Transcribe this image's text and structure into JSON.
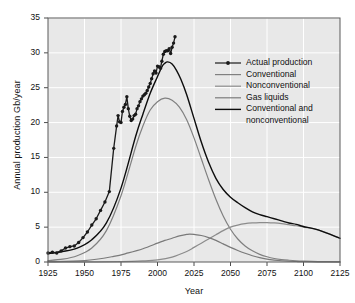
{
  "chart_data": {
    "type": "line",
    "title": "",
    "xlabel": "Year",
    "ylabel": "Annual production Gb/year",
    "xlim": [
      1925,
      2125
    ],
    "ylim": [
      0,
      35
    ],
    "xticks": [
      1925,
      1950,
      1975,
      2000,
      2025,
      2050,
      2075,
      2100,
      2125
    ],
    "yticks": [
      0,
      5,
      10,
      15,
      20,
      25,
      30,
      35
    ],
    "grid": true,
    "legend_position": "upper right",
    "background": "#e8e8e8",
    "gridline_color": "#ffffff",
    "series": [
      {
        "name": "Actual production",
        "color": "#1a1a1a",
        "width": 1.3,
        "marker": "circle",
        "x": [
          1925,
          1928,
          1931,
          1934,
          1937,
          1940,
          1943,
          1946,
          1949,
          1952,
          1955,
          1958,
          1961,
          1964,
          1967,
          1970,
          1972,
          1973,
          1974,
          1975,
          1976,
          1977,
          1978,
          1979,
          1980,
          1981,
          1982,
          1983,
          1984,
          1985,
          1986,
          1987,
          1988,
          1989,
          1990,
          1991,
          1992,
          1993,
          1994,
          1995,
          1996,
          1997,
          1998,
          1999,
          2000,
          2001,
          2002,
          2003,
          2004,
          2005,
          2006,
          2007,
          2008,
          2009,
          2010,
          2011,
          2012
        ],
        "y": [
          1.3,
          1.4,
          1.3,
          1.6,
          2.0,
          2.2,
          2.3,
          2.8,
          3.5,
          4.3,
          5.3,
          6.2,
          7.4,
          8.6,
          10.1,
          16.3,
          19.5,
          21.0,
          20.1,
          20.0,
          21.6,
          22.2,
          22.6,
          23.7,
          22.0,
          20.9,
          20.3,
          20.5,
          21.0,
          21.2,
          22.0,
          22.4,
          23.0,
          23.4,
          23.8,
          24.0,
          24.2,
          24.6,
          25.1,
          25.6,
          26.3,
          27.0,
          27.4,
          27.1,
          28.1,
          28.0,
          27.8,
          28.8,
          29.8,
          30.2,
          30.3,
          30.3,
          30.6,
          29.9,
          30.8,
          31.4,
          32.3
        ]
      },
      {
        "name": "Conventional",
        "color": "#808080",
        "width": 1.2,
        "marker": "none",
        "x": [
          1925,
          1935,
          1945,
          1955,
          1965,
          1975,
          1985,
          1990,
          1995,
          2000,
          2005,
          2010,
          2015,
          2020,
          2025,
          2030,
          2035,
          2040,
          2045,
          2050,
          2055,
          2060,
          2065,
          2070,
          2075,
          2080,
          2085,
          2090,
          2095,
          2100,
          2110,
          2125
        ],
        "y": [
          0.2,
          0.4,
          0.9,
          2.0,
          4.5,
          9.5,
          16.5,
          19.5,
          21.8,
          23.0,
          23.5,
          23.2,
          22.2,
          20.4,
          17.8,
          14.8,
          11.8,
          9.0,
          6.6,
          4.7,
          3.3,
          2.3,
          1.6,
          1.1,
          0.75,
          0.5,
          0.35,
          0.25,
          0.17,
          0.12,
          0.06,
          0.02
        ]
      },
      {
        "name": "Nonconventional",
        "color": "#8c8c8c",
        "width": 1.2,
        "marker": "none",
        "x": [
          1925,
          1950,
          1975,
          1990,
          2000,
          2010,
          2020,
          2025,
          2030,
          2035,
          2040,
          2045,
          2050,
          2055,
          2060,
          2065,
          2070,
          2075,
          2080,
          2085,
          2090,
          2095,
          2100,
          2110,
          2125
        ],
        "y": [
          0.0,
          0.02,
          0.05,
          0.15,
          0.3,
          0.7,
          1.5,
          2.1,
          2.7,
          3.3,
          3.9,
          4.5,
          5.0,
          5.3,
          5.5,
          5.6,
          5.65,
          5.65,
          5.6,
          5.5,
          5.35,
          5.2,
          5.0,
          4.6,
          3.4
        ]
      },
      {
        "name": "Gas liquids",
        "color": "#7a7a7a",
        "width": 1.2,
        "marker": "none",
        "x": [
          1925,
          1950,
          1970,
          1980,
          1990,
          2000,
          2005,
          2010,
          2015,
          2020,
          2022,
          2025,
          2030,
          2035,
          2040,
          2045,
          2050,
          2055,
          2060,
          2065,
          2070,
          2075,
          2080,
          2085,
          2090,
          2095,
          2100,
          2110,
          2125
        ],
        "y": [
          0.05,
          0.2,
          0.8,
          1.3,
          1.9,
          2.7,
          3.1,
          3.4,
          3.75,
          3.95,
          4.0,
          3.95,
          3.8,
          3.5,
          3.1,
          2.6,
          2.1,
          1.65,
          1.25,
          0.9,
          0.62,
          0.42,
          0.28,
          0.18,
          0.11,
          0.07,
          0.04,
          0.015,
          0.005
        ]
      },
      {
        "name": "Conventional and nonconventional",
        "color": "#0d0d0d",
        "width": 1.4,
        "marker": "none",
        "x": [
          1925,
          1935,
          1945,
          1955,
          1965,
          1975,
          1985,
          1990,
          1995,
          2000,
          2003,
          2005,
          2007,
          2010,
          2013,
          2016,
          2020,
          2025,
          2030,
          2035,
          2040,
          2045,
          2050,
          2055,
          2060,
          2065,
          2070,
          2075,
          2080,
          2085,
          2090,
          2095,
          2100,
          2110,
          2125
        ],
        "y": [
          1.2,
          1.5,
          2.0,
          3.2,
          5.6,
          10.6,
          18.0,
          21.2,
          24.2,
          26.6,
          28.0,
          28.5,
          28.7,
          28.4,
          27.5,
          26.2,
          24.0,
          20.6,
          17.2,
          14.3,
          12.0,
          10.4,
          9.3,
          8.5,
          7.8,
          7.2,
          6.8,
          6.5,
          6.2,
          5.9,
          5.6,
          5.4,
          5.1,
          4.6,
          3.4
        ]
      }
    ]
  },
  "legend": {
    "items": [
      {
        "label": "Actual production",
        "color": "#1a1a1a",
        "marker": true
      },
      {
        "label": "Conventional",
        "color": "#808080",
        "marker": false
      },
      {
        "label": "Nonconventional",
        "color": "#8c8c8c",
        "marker": false
      },
      {
        "label": "Gas liquids",
        "color": "#7a7a7a",
        "marker": false
      },
      {
        "label": "Conventional and",
        "color": "#0d0d0d",
        "marker": false
      },
      {
        "label": "nonconventional",
        "color": "",
        "marker": false
      }
    ]
  },
  "axes": {
    "x_title": "Year",
    "y_title": "Annual production Gb/year",
    "x_tick_labels": [
      "1925",
      "1950",
      "1975",
      "2000",
      "2025",
      "2050",
      "2075",
      "2100",
      "2125"
    ],
    "y_tick_labels": [
      "0",
      "5",
      "10",
      "15",
      "20",
      "25",
      "30",
      "35"
    ]
  }
}
